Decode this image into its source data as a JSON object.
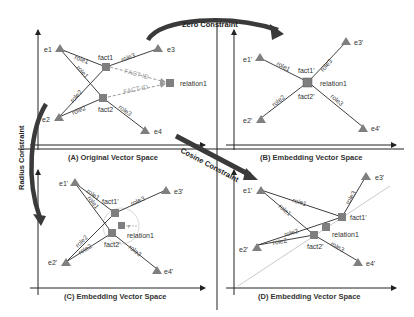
{
  "panels": {
    "A": {
      "caption": "(A) Original Vector Space"
    },
    "B": {
      "caption": "(B) Embedding Vector Space"
    },
    "C": {
      "caption": "(C) Embedding Vector Space"
    },
    "D": {
      "caption": "(D) Embedding Vector Space"
    }
  },
  "constraints": {
    "zero": "Zero Constraint",
    "radius": "Radius Constraint",
    "cosine": "Cosine Constraint"
  },
  "labels": {
    "A": {
      "e1": "e1",
      "e2": "e2",
      "e3": "e3",
      "e4": "e4",
      "fact1": "fact1",
      "fact2": "fact2",
      "relation": "relation1",
      "factid1": "FACT-ID",
      "factid2": "FACT-ID",
      "role1a": "role1",
      "role1b": "role1",
      "role2a": "role2",
      "role2b": "role2",
      "role3a": "role3",
      "role3b": "role3"
    },
    "B": {
      "e1": "e1'",
      "e2": "e2'",
      "e3": "e3'",
      "e4": "e4'",
      "fact1": "fact1'",
      "fact2": "fact2'",
      "relation": "relation1",
      "role1": "role1",
      "role2": "role2",
      "role3a": "role3",
      "role3b": "role3"
    },
    "C": {
      "e1": "e1'",
      "e2": "e2'",
      "e3": "e3'",
      "e4": "e4'",
      "fact1": "fact1'",
      "fact2": "fact2'",
      "relation": "relation1",
      "radius": "r",
      "role1a": "role1",
      "role1b": "role1",
      "role2a": "role2",
      "role2b": "role2",
      "role3a": "role3",
      "role3b": "role3"
    },
    "D": {
      "e1": "e1'",
      "e2": "e2'",
      "e3": "e3'",
      "e4": "e4'",
      "fact1": "fact1'",
      "fact2": "fact2'",
      "relation": "relation1",
      "role1a": "role1",
      "role1b": "role1",
      "role2a": "role2",
      "role2b": "role2",
      "role3a": "role3",
      "role3b": "role3"
    }
  },
  "colors": {
    "node": "#7f7f7f",
    "edge": "#404040",
    "arrow": "#505050",
    "axis": "#222222",
    "dashed": "#9a9a9a"
  }
}
